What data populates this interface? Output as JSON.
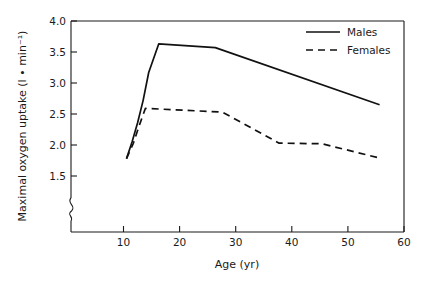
{
  "chart_data": {
    "type": "line",
    "title": "",
    "xlabel": "Age (yr)",
    "ylabel": "Maximal oxygen uptake (l • min⁻¹)",
    "xlim": [
      0,
      60
    ],
    "ylim": [
      1.3,
      4.0
    ],
    "y_axis_break": true,
    "y_axis_break_note": "axis broken below 1.5",
    "grid": false,
    "legend_position": "top-right",
    "xticks": [
      10,
      20,
      30,
      40,
      50,
      60
    ],
    "xtick_labels": [
      "10",
      "20",
      "30",
      "40",
      "50",
      "60"
    ],
    "yticks": [
      1.5,
      2.0,
      2.5,
      3.0,
      3.5,
      4.0
    ],
    "ytick_labels": [
      "1.5",
      "2.0",
      "2.5",
      "3.0",
      "3.5",
      "4.0"
    ],
    "series": [
      {
        "name": "Males",
        "style": "solid",
        "color": "#111111",
        "x": [
          10.0,
          11.0,
          12.0,
          13.0,
          14.0,
          15.8,
          26.0,
          55.6
        ],
        "y": [
          1.78,
          2.05,
          2.36,
          2.72,
          3.17,
          3.63,
          3.57,
          2.65
        ]
      },
      {
        "name": "Females",
        "style": "dashed",
        "color": "#111111",
        "x": [
          10.0,
          11.2,
          12.4,
          13.4,
          16.0,
          27.3,
          37.5,
          45.2,
          55.6
        ],
        "y": [
          1.78,
          2.02,
          2.34,
          2.59,
          2.58,
          2.53,
          2.03,
          2.02,
          1.79
        ]
      }
    ],
    "legend_entries": [
      {
        "label": "Males",
        "style": "solid"
      },
      {
        "label": "Females",
        "style": "dashed"
      }
    ]
  }
}
